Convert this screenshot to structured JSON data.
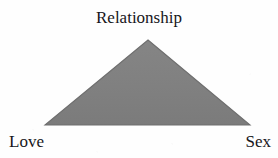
{
  "diagram": {
    "type": "triangle-diagram",
    "title": "Relationship",
    "vertices": {
      "apex_label": "Relationship",
      "bottom_left_label": "Love",
      "bottom_right_label": "Sex"
    },
    "shape": {
      "name": "triangle",
      "apex_x": 148,
      "apex_y": 40,
      "left_x": 45,
      "left_y": 125,
      "right_x": 250,
      "right_y": 125,
      "fill_color": "#808080",
      "stroke_color": "#6e6e6e"
    },
    "background_color": "#fefefe",
    "text_color": "#17161a"
  }
}
